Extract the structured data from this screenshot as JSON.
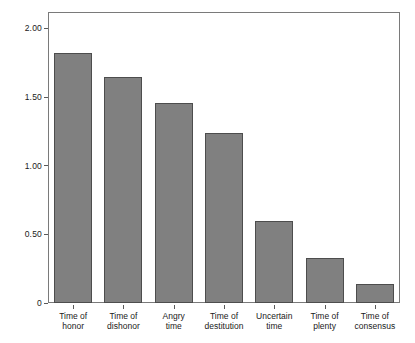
{
  "chart_data": {
    "type": "bar",
    "title": "",
    "subtitle": "",
    "xlabel": "",
    "ylabel": "",
    "categories": [
      "Time of\nhonor",
      "Time of\ndishonor",
      "Angry\ntime",
      "Time of\ndestitution",
      "Uncertain\ntime",
      "Time of\nplenty",
      "Time of\nconsensus"
    ],
    "values": [
      1.82,
      1.65,
      1.46,
      1.24,
      0.6,
      0.33,
      0.14
    ],
    "ylim": [
      0,
      2.12
    ],
    "yticks": [
      0,
      0.5,
      1.0,
      1.5,
      2.0
    ],
    "ytick_labels": [
      "0",
      "0.50",
      "1.00",
      "1.50",
      "2.00"
    ],
    "grid": false,
    "legend": null,
    "bar_color": "#808080",
    "bar_edge_color": "#4d4d4d",
    "frame_color": "#7a7a7a",
    "background": "#ffffff"
  }
}
